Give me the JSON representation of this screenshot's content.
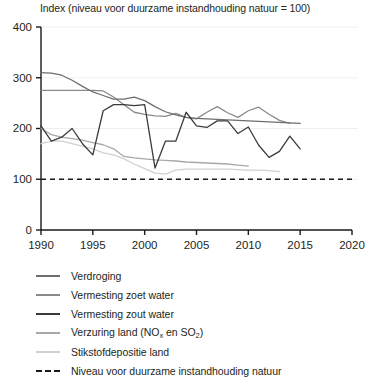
{
  "chart_data": {
    "type": "line",
    "title": "Index (niveau voor duurzame instandhouding natuur = 100)",
    "xlabel": "",
    "ylabel": "",
    "xlim": [
      1990,
      2020
    ],
    "ylim": [
      0,
      400
    ],
    "xticks": [
      "1990",
      "1995",
      "2000",
      "2005",
      "2010",
      "2015",
      "2020"
    ],
    "yticks": [
      "0",
      "100",
      "200",
      "300",
      "400"
    ],
    "grid": true,
    "legend_position": "below",
    "reference_line": {
      "label": "Niveau voor duurzame instandhouding natuur",
      "value": 100,
      "style": "dashed",
      "color": "#1a1a1a"
    },
    "series": [
      {
        "name": "Verdroging",
        "color": "#6e6e6e",
        "x": [
          1990,
          1991,
          1992,
          1993,
          1994,
          1995,
          1996,
          1997,
          1998,
          1999,
          2000,
          2001,
          2002,
          2003,
          2004,
          2005,
          2006,
          2007,
          2008,
          2009,
          2010,
          2011,
          2012,
          2013,
          2014,
          2015
        ],
        "values": [
          310,
          309,
          305,
          295,
          283,
          272,
          265,
          258,
          258,
          262,
          255,
          243,
          233,
          227,
          222,
          220,
          219,
          218,
          217,
          216,
          215,
          214,
          213,
          212,
          211,
          210
        ]
      },
      {
        "name": "Vermesting zoet water",
        "color": "#8a8a8a",
        "x": [
          1990,
          1991,
          1992,
          1993,
          1994,
          1995,
          1996,
          1997,
          1998,
          1999,
          2000,
          2001,
          2002,
          2003,
          2004,
          2005,
          2006,
          2007,
          2008,
          2009,
          2010,
          2011,
          2012,
          2013,
          2014
        ],
        "values": [
          275,
          275,
          275,
          275,
          275,
          275,
          274,
          262,
          247,
          232,
          228,
          225,
          224,
          230,
          222,
          219,
          232,
          243,
          231,
          222,
          235,
          242,
          228,
          216,
          210
        ]
      },
      {
        "name": "Vermesting zout water",
        "color": "#3b3b3b",
        "x": [
          1990,
          1991,
          1992,
          1993,
          1994,
          1995,
          1996,
          1997,
          1998,
          1999,
          2000,
          2001,
          2002,
          2003,
          2004,
          2005,
          2006,
          2007,
          2008,
          2009,
          2010,
          2011,
          2012,
          2013,
          2014,
          2015
        ],
        "values": [
          205,
          175,
          183,
          200,
          170,
          148,
          235,
          247,
          247,
          245,
          247,
          122,
          175,
          175,
          232,
          205,
          202,
          215,
          215,
          190,
          203,
          167,
          143,
          155,
          185,
          160
        ]
      },
      {
        "name": "Verzuring land (NOx en SO2)",
        "color": "#a8a8a8",
        "x": [
          1990,
          1991,
          1992,
          1993,
          1994,
          1995,
          1996,
          1997,
          1998,
          1999,
          2000,
          2001,
          2002,
          2003,
          2004,
          2005,
          2006,
          2007,
          2008,
          2009,
          2010
        ],
        "values": [
          200,
          188,
          183,
          180,
          177,
          172,
          168,
          160,
          145,
          142,
          140,
          138,
          137,
          136,
          134,
          133,
          132,
          131,
          130,
          128,
          126
        ]
      },
      {
        "name": "Stikstofdepositie land",
        "color": "#d0d0d0",
        "x": [
          1990,
          1991,
          1992,
          1993,
          1994,
          1995,
          1996,
          1997,
          1998,
          1999,
          2000,
          2001,
          2002,
          2003,
          2004,
          2005,
          2006,
          2007,
          2008,
          2009,
          2010,
          2011,
          2012,
          2013
        ],
        "values": [
          170,
          175,
          175,
          170,
          165,
          160,
          152,
          148,
          140,
          130,
          121,
          112,
          110,
          118,
          120,
          120,
          120,
          120,
          120,
          119,
          118,
          118,
          117,
          115
        ]
      }
    ]
  },
  "legend": {
    "items": [
      {
        "label": "Verdroging",
        "color": "#6e6e6e",
        "style": "solid"
      },
      {
        "label": "Vermesting zoet water",
        "color": "#8a8a8a",
        "style": "solid"
      },
      {
        "label": "Vermesting zout water",
        "color": "#3b3b3b",
        "style": "solid"
      },
      {
        "label": "Verzuring land (NOx en SO2)",
        "color": "#a8a8a8",
        "style": "solid"
      },
      {
        "label": "Stikstofdepositie land",
        "color": "#d0d0d0",
        "style": "solid"
      },
      {
        "label": "Niveau voor duurzame instandhouding natuur",
        "color": "#1a1a1a",
        "style": "dashed"
      }
    ]
  }
}
